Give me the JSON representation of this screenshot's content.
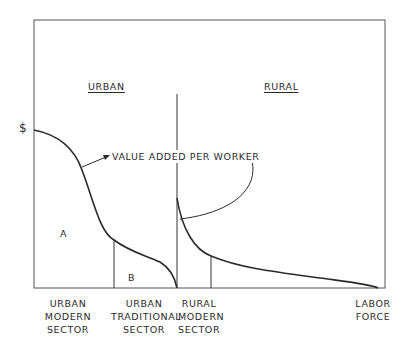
{
  "diagram": {
    "y_axis_label": "$",
    "regions": {
      "urban": "URBAN",
      "rural": "RURAL"
    },
    "curve_label": "VALUE ADDED PER WORKER",
    "areas": {
      "a": "A",
      "b": "B"
    },
    "x_axis_labels": [
      {
        "line1": "URBAN",
        "line2": "MODERN",
        "line3": "SECTOR"
      },
      {
        "line1": "URBAN",
        "line2": "TRADITIONAL",
        "line3": "SECTOR"
      },
      {
        "line1": "RURAL",
        "line2": "MODERN",
        "line3": "SECTOR"
      },
      {
        "line1": "LABOR",
        "line2": "FORCE"
      }
    ],
    "colors": {
      "line": "#2a2a2a",
      "background": "#ffffff"
    }
  }
}
